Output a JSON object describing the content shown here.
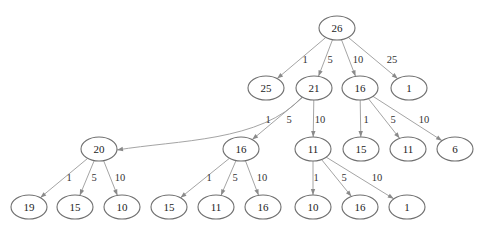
{
  "diagram": {
    "type": "tree",
    "nodes": [
      {
        "id": "n0",
        "label": "26"
      },
      {
        "id": "n1",
        "label": "25"
      },
      {
        "id": "n2",
        "label": "21"
      },
      {
        "id": "n3",
        "label": "16"
      },
      {
        "id": "n4",
        "label": "1"
      },
      {
        "id": "n5",
        "label": "20"
      },
      {
        "id": "n6",
        "label": "16"
      },
      {
        "id": "n7",
        "label": "11"
      },
      {
        "id": "n8",
        "label": "15"
      },
      {
        "id": "n9",
        "label": "11"
      },
      {
        "id": "n10",
        "label": "6"
      },
      {
        "id": "n11",
        "label": "19"
      },
      {
        "id": "n12",
        "label": "15"
      },
      {
        "id": "n13",
        "label": "10"
      },
      {
        "id": "n14",
        "label": "15"
      },
      {
        "id": "n15",
        "label": "11"
      },
      {
        "id": "n16",
        "label": "16"
      },
      {
        "id": "n17",
        "label": "10"
      },
      {
        "id": "n18",
        "label": "16"
      },
      {
        "id": "n19",
        "label": "1"
      }
    ],
    "edges": [
      {
        "from": "n0",
        "to": "n1",
        "label": "1"
      },
      {
        "from": "n0",
        "to": "n2",
        "label": "5"
      },
      {
        "from": "n0",
        "to": "n3",
        "label": "10"
      },
      {
        "from": "n0",
        "to": "n4",
        "label": "25"
      },
      {
        "from": "n2",
        "to": "n5",
        "label": "1"
      },
      {
        "from": "n2",
        "to": "n6",
        "label": "5"
      },
      {
        "from": "n2",
        "to": "n7",
        "label": "10"
      },
      {
        "from": "n3",
        "to": "n8",
        "label": "1"
      },
      {
        "from": "n3",
        "to": "n9",
        "label": "5"
      },
      {
        "from": "n3",
        "to": "n10",
        "label": "10"
      },
      {
        "from": "n5",
        "to": "n11",
        "label": "1"
      },
      {
        "from": "n5",
        "to": "n12",
        "label": "5"
      },
      {
        "from": "n5",
        "to": "n13",
        "label": "10"
      },
      {
        "from": "n6",
        "to": "n14",
        "label": "1"
      },
      {
        "from": "n6",
        "to": "n15",
        "label": "5"
      },
      {
        "from": "n6",
        "to": "n16",
        "label": "10"
      },
      {
        "from": "n7",
        "to": "n17",
        "label": "1"
      },
      {
        "from": "n7",
        "to": "n18",
        "label": "5"
      },
      {
        "from": "n7",
        "to": "n19",
        "label": "10"
      }
    ]
  }
}
